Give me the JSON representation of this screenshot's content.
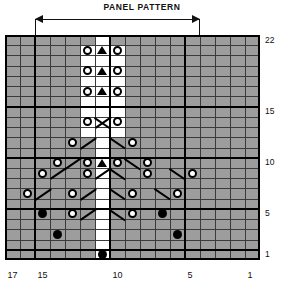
{
  "title": "PANEL PATTERN",
  "colors": {
    "purl_cell": "#9d9d9d",
    "knit_cell": "#ffffff",
    "symbol": "#000000",
    "gridline": "#3a3a3a",
    "heavy_gridline": "#000000"
  },
  "chart_data": {
    "type": "table",
    "title": "PANEL PATTERN",
    "xlabel": "",
    "ylabel": "",
    "columns": 17,
    "rows": 22,
    "column_order": "right-to-left",
    "row_order": "bottom-to-top",
    "column_tick_labels": [
      "17",
      "15",
      "10",
      "5",
      "1"
    ],
    "column_tick_positions": [
      17,
      15,
      10,
      5,
      1
    ],
    "row_tick_labels": [
      "22",
      "15",
      "10",
      "5",
      "1"
    ],
    "row_tick_positions": [
      22,
      15,
      10,
      5,
      1
    ],
    "heavy_row_separators": [
      1,
      5,
      10,
      15,
      22
    ],
    "heavy_column_separators": [
      5,
      10,
      15
    ],
    "panel_span_columns": [
      5,
      15
    ],
    "legend": [
      {
        "symbol": "grey-cell",
        "name": "purl-stitch"
      },
      {
        "symbol": "white-cell",
        "name": "knit-stitch"
      },
      {
        "symbol": "open-circle",
        "name": "yarn-over"
      },
      {
        "symbol": "filled-circle",
        "name": "bobble"
      },
      {
        "symbol": "black-triangle",
        "name": "double-decrease"
      },
      {
        "symbol": "diagonal-line",
        "name": "cable-travel"
      }
    ],
    "white_cells": [
      {
        "row": 1,
        "cols": [
          11
        ]
      },
      {
        "row": 2,
        "cols": [
          11
        ]
      },
      {
        "row": 3,
        "cols": [
          11
        ]
      },
      {
        "row": 4,
        "cols": [
          11
        ]
      },
      {
        "row": 5,
        "cols": [
          11
        ]
      },
      {
        "row": 6,
        "cols": [
          11
        ]
      },
      {
        "row": 7,
        "cols": [
          11
        ]
      },
      {
        "row": 8,
        "cols": [
          11
        ]
      },
      {
        "row": 9,
        "cols": [
          11
        ]
      },
      {
        "row": 10,
        "cols": [
          11
        ]
      },
      {
        "row": 11,
        "cols": [
          11
        ]
      },
      {
        "row": 12,
        "cols": [
          11
        ]
      },
      {
        "row": 13,
        "cols": [
          10,
          11,
          12
        ]
      },
      {
        "row": 14,
        "cols": [
          10,
          11,
          12
        ]
      },
      {
        "row": 15,
        "cols": [
          10,
          11,
          12
        ]
      },
      {
        "row": 16,
        "cols": [
          10,
          11,
          12
        ]
      },
      {
        "row": 17,
        "cols": [
          10,
          11,
          12
        ]
      },
      {
        "row": 18,
        "cols": [
          10,
          11,
          12
        ]
      },
      {
        "row": 19,
        "cols": [
          10,
          11,
          12
        ]
      },
      {
        "row": 20,
        "cols": [
          10,
          11,
          12
        ]
      },
      {
        "row": 21,
        "cols": [
          10,
          11,
          12
        ]
      },
      {
        "row": 22,
        "cols": [
          11
        ]
      }
    ],
    "symbols": [
      {
        "type": "filled-circle",
        "row": 1,
        "col": 11
      },
      {
        "type": "filled-circle",
        "row": 3,
        "col": 14
      },
      {
        "type": "filled-circle",
        "row": 3,
        "col": 6
      },
      {
        "type": "filled-circle",
        "row": 5,
        "col": 15
      },
      {
        "type": "open-circle",
        "row": 5,
        "col": 13
      },
      {
        "type": "diagonal-up",
        "row": 5,
        "col": 12
      },
      {
        "type": "diagonal-down",
        "row": 5,
        "col": 10
      },
      {
        "type": "open-circle",
        "row": 5,
        "col": 9
      },
      {
        "type": "filled-circle",
        "row": 5,
        "col": 7
      },
      {
        "type": "open-circle",
        "row": 7,
        "col": 16
      },
      {
        "type": "diagonal-up",
        "row": 7,
        "col": 15
      },
      {
        "type": "open-circle",
        "row": 7,
        "col": 13
      },
      {
        "type": "diagonal-up",
        "row": 7,
        "col": 12
      },
      {
        "type": "diagonal-down",
        "row": 7,
        "col": 10
      },
      {
        "type": "open-circle",
        "row": 7,
        "col": 9
      },
      {
        "type": "diagonal-down",
        "row": 7,
        "col": 7
      },
      {
        "type": "open-circle",
        "row": 7,
        "col": 6
      },
      {
        "type": "open-circle",
        "row": 9,
        "col": 15
      },
      {
        "type": "diagonal-up",
        "row": 9,
        "col": 14
      },
      {
        "type": "open-circle",
        "row": 9,
        "col": 12
      },
      {
        "type": "diagonal-up",
        "row": 9,
        "col": 11
      },
      {
        "type": "diagonal-down",
        "row": 9,
        "col": 10
      },
      {
        "type": "open-circle",
        "row": 9,
        "col": 8
      },
      {
        "type": "diagonal-down",
        "row": 9,
        "col": 6
      },
      {
        "type": "open-circle",
        "row": 9,
        "col": 5
      },
      {
        "type": "open-circle",
        "row": 10,
        "col": 14
      },
      {
        "type": "diagonal-up",
        "row": 10,
        "col": 13
      },
      {
        "type": "open-circle",
        "row": 10,
        "col": 12
      },
      {
        "type": "black-triangle",
        "row": 10,
        "col": 11
      },
      {
        "type": "open-circle",
        "row": 10,
        "col": 10
      },
      {
        "type": "diagonal-down",
        "row": 10,
        "col": 9
      },
      {
        "type": "open-circle",
        "row": 10,
        "col": 8
      },
      {
        "type": "open-circle",
        "row": 12,
        "col": 13
      },
      {
        "type": "diagonal-up",
        "row": 12,
        "col": 12
      },
      {
        "type": "diagonal-down",
        "row": 12,
        "col": 10
      },
      {
        "type": "open-circle",
        "row": 12,
        "col": 9
      },
      {
        "type": "open-circle",
        "row": 14,
        "col": 12
      },
      {
        "type": "diagonal-up",
        "row": 14,
        "col": 11
      },
      {
        "type": "diagonal-down",
        "row": 14,
        "col": 11
      },
      {
        "type": "open-circle",
        "row": 14,
        "col": 10
      },
      {
        "type": "open-circle",
        "row": 17,
        "col": 12
      },
      {
        "type": "black-triangle",
        "row": 17,
        "col": 11
      },
      {
        "type": "open-circle",
        "row": 17,
        "col": 10
      },
      {
        "type": "open-circle",
        "row": 19,
        "col": 12
      },
      {
        "type": "black-triangle",
        "row": 19,
        "col": 11
      },
      {
        "type": "open-circle",
        "row": 19,
        "col": 10
      },
      {
        "type": "open-circle",
        "row": 21,
        "col": 12
      },
      {
        "type": "black-triangle",
        "row": 21,
        "col": 11
      },
      {
        "type": "open-circle",
        "row": 21,
        "col": 10
      }
    ]
  }
}
